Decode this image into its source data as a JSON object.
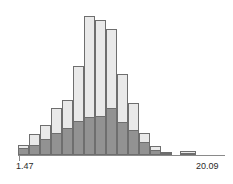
{
  "figure": {
    "type": "histogram-figure",
    "background_color": "#ffffff",
    "width": 233,
    "height": 184
  },
  "axis": {
    "baseline_y": 155,
    "left_x": 18,
    "right_x": 225,
    "tick_left_x": 19,
    "line_color": "#8a8a8a",
    "min_label": "1.47",
    "max_label": "20.09"
  },
  "style": {
    "light_fill": "#e9e9e9",
    "dark_fill": "#929292",
    "bar_border": "#6e6e6e"
  },
  "chart_data": {
    "type": "bar",
    "title": "",
    "subtitle": "",
    "xlabel": "",
    "ylabel": "",
    "grid": false,
    "legend_position": "none",
    "orientation": "vertical",
    "xlim": [
      1.47,
      20.09
    ],
    "xtick_labels": [
      "1.47",
      "20.09"
    ],
    "ylim": [
      0,
      140
    ],
    "bin_width_value": 1.16,
    "bin_count": 16,
    "bin_left_edges": [
      1.47,
      2.63,
      3.79,
      4.96,
      6.12,
      7.28,
      8.44,
      9.61,
      10.77,
      11.93,
      13.09,
      14.26,
      15.42,
      16.58,
      17.74,
      18.91
    ],
    "bin_centers": [
      2.05,
      3.21,
      4.37,
      5.54,
      6.7,
      7.86,
      9.02,
      10.19,
      11.35,
      12.51,
      13.67,
      14.84,
      16.0,
      17.16,
      18.32,
      19.49
    ],
    "series": [
      {
        "name": "total",
        "color": "#e9e9e9",
        "values": [
          7,
          19,
          38,
          62,
          79,
          104,
          130,
          126,
          120,
          87,
          65,
          33,
          14,
          5,
          0,
          3
        ]
      },
      {
        "name": "subgroup",
        "color": "#929292",
        "values": [
          5,
          7,
          20,
          26,
          34,
          46,
          50,
          52,
          44,
          27,
          19,
          11,
          5,
          3,
          0,
          2
        ]
      }
    ],
    "bars_px": [
      {
        "index": 0,
        "x": 18,
        "w": 11,
        "light_top": 145,
        "dark_top": 148
      },
      {
        "index": 1,
        "x": 29,
        "w": 11,
        "light_top": 134,
        "dark_top": 145
      },
      {
        "index": 2,
        "x": 40,
        "w": 11,
        "light_top": 125,
        "dark_top": 139
      },
      {
        "index": 3,
        "x": 51,
        "w": 11,
        "light_top": 108,
        "dark_top": 133
      },
      {
        "index": 4,
        "x": 62,
        "w": 11,
        "light_top": 100,
        "dark_top": 128
      },
      {
        "index": 5,
        "x": 73,
        "w": 11,
        "light_top": 66,
        "dark_top": 121
      },
      {
        "index": 6,
        "x": 84,
        "w": 11,
        "light_top": 16,
        "dark_top": 117
      },
      {
        "index": 7,
        "x": 95,
        "w": 11,
        "light_top": 20,
        "dark_top": 116
      },
      {
        "index": 8,
        "x": 106,
        "w": 11,
        "light_top": 29,
        "dark_top": 108
      },
      {
        "index": 9,
        "x": 117,
        "w": 11,
        "light_top": 74,
        "dark_top": 122
      },
      {
        "index": 10,
        "x": 128,
        "w": 11,
        "light_top": 103,
        "dark_top": 130
      },
      {
        "index": 11,
        "x": 139,
        "w": 11,
        "light_top": 133,
        "dark_top": 142
      },
      {
        "index": 12,
        "x": 150,
        "w": 11,
        "light_top": 146,
        "dark_top": 150
      },
      {
        "index": 13,
        "x": 161,
        "w": 11,
        "light_top": 152,
        "dark_top": 153
      },
      {
        "index": 14,
        "x": 180,
        "w": 16,
        "light_top": 151,
        "dark_top": 153
      }
    ]
  }
}
